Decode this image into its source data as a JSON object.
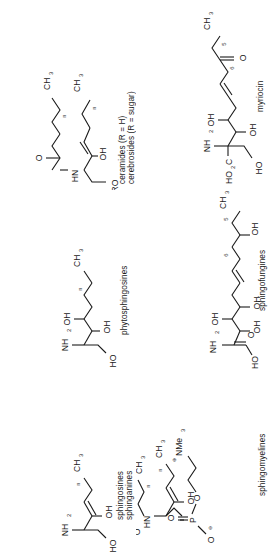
{
  "figure": {
    "panel_count": 6,
    "rotation_deg": -90,
    "background": "#ffffff",
    "ink": "#1a1a1a"
  },
  "panels": [
    {
      "id": "ceramides",
      "position": "top-left",
      "caption_lines": "ceramides (R = H)\ncerebrosides (R = sugar)\ngangliosides (R = sugar + sialic\n                     acid residues)",
      "caption_line_1": "ceramides (R = H)",
      "caption_line_2": "cerebrosides (R = sugar)",
      "caption_line_3": "gangliosides (R = sugar + sialic",
      "caption_line_4": "acid residues)",
      "atom_labels": [
        "CH",
        "3",
        "n",
        "n",
        "O",
        "HN",
        "OH",
        "RO"
      ],
      "group_RO": "RO",
      "group_HN": "HN",
      "group_OH": "OH",
      "group_CH3": "CH",
      "sub_3": "3",
      "sub_n": "n",
      "carbonyl_O": "O"
    },
    {
      "id": "myriocin",
      "position": "top-right",
      "caption_lines": "myriocin",
      "atom_labels": [
        "CH",
        "3",
        "5",
        "6",
        "O",
        "OH",
        "NH",
        "2",
        "OH",
        "HO",
        "C",
        "2",
        "HO"
      ],
      "group_CH3": "CH",
      "sub_3": "3",
      "sub_5": "5",
      "sub_6": "6",
      "ketone_O": "O",
      "group_OH_a": "OH",
      "group_NH2": "NH",
      "sub_2": "2",
      "group_OH_b": "OH",
      "group_HO2C": "HO",
      "sub_2b": "2",
      "group_C": "C",
      "group_HO": "HO"
    },
    {
      "id": "phytosphingosines",
      "position": "middle-left",
      "caption_lines": "phytosphingosines",
      "atom_labels": [
        "CH",
        "3",
        "n",
        "OH",
        "OH",
        "NH",
        "2",
        "HO"
      ],
      "group_CH3": "CH",
      "sub_3": "3",
      "sub_n": "n",
      "group_OH_a": "OH",
      "group_OH_b": "OH",
      "group_NH2": "NH",
      "sub_2": "2",
      "group_HO": "HO"
    },
    {
      "id": "sphingofungines",
      "position": "middle-right",
      "caption_lines": "sphingofungines",
      "atom_labels": [
        "CH",
        "3",
        "5",
        "6",
        "OH",
        "OH",
        "OH",
        "NH",
        "2",
        "O",
        "HO"
      ],
      "group_CH3": "CH",
      "sub_3": "3",
      "sub_5": "5",
      "sub_6": "6",
      "group_OH_a": "OH",
      "group_OH_b": "OH",
      "group_OH_c": "OH",
      "group_NH2": "NH",
      "sub_2": "2",
      "acid_O": "O",
      "group_HO": "HO"
    },
    {
      "id": "sphingosines-sphinganines",
      "position": "bottom-left",
      "caption_lines": "sphingosines\nsphinganines",
      "caption_line_1": "sphingosines",
      "caption_line_2": "sphinganines",
      "atom_labels": [
        "CH",
        "3",
        "n",
        "OH",
        "NH",
        "2",
        "HO"
      ],
      "group_CH3": "CH",
      "sub_3": "3",
      "sub_n": "n",
      "group_OH": "OH",
      "group_NH2": "NH",
      "sub_2": "2",
      "group_HO": "HO"
    },
    {
      "id": "sphingomyelines",
      "position": "bottom-right",
      "caption_lines": "sphingomyelines",
      "atom_labels": [
        "CH",
        "3",
        "n",
        "CH",
        "3",
        "n",
        "O",
        "HN",
        "OH",
        "O",
        "P",
        "O",
        "O",
        "NMe",
        "3"
      ],
      "group_CH3_a": "CH",
      "sub_3a": "3",
      "sub_na": "n",
      "group_CH3_b": "CH",
      "sub_3b": "3",
      "sub_nb": "n",
      "carbonyl_O": "O",
      "group_HN": "HN",
      "group_OH": "OH",
      "phos_P": "P",
      "phos_O1": "O",
      "phos_O2": "O",
      "phos_O3": "O",
      "phos_minus": "⊖",
      "group_NMe3": "NMe",
      "sub_3c": "3",
      "plus": "⊕"
    }
  ]
}
